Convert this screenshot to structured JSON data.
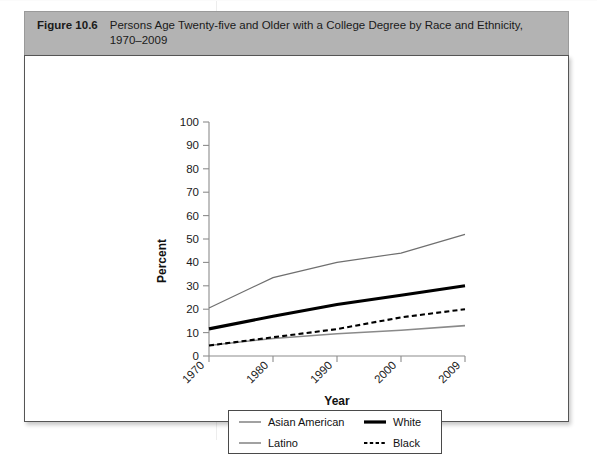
{
  "figure": {
    "number": "Figure 10.6",
    "title": "Persons Age Twenty-five and Older with a College Degree by Race and Ethnicity, 1970–2009"
  },
  "chart_data": {
    "type": "line",
    "title": "",
    "xlabel": "Year",
    "ylabel": "Percent",
    "x": [
      "1970",
      "1980",
      "1990",
      "2000",
      "2009"
    ],
    "xlim": [
      1970,
      2009
    ],
    "ylim": [
      0,
      100
    ],
    "yticks": [
      "0",
      "10",
      "20",
      "30",
      "40",
      "50",
      "60",
      "70",
      "80",
      "90",
      "100"
    ],
    "grid": false,
    "legend_position": "below-plot",
    "series": [
      {
        "name": "Asian American",
        "style": "thin-gray-solid",
        "color": "#6f6f6f",
        "values": [
          20.5,
          33.5,
          40.0,
          44.0,
          52.0
        ]
      },
      {
        "name": "White",
        "style": "thick-black-solid",
        "color": "#000000",
        "values": [
          11.6,
          17.0,
          22.0,
          26.0,
          30.0
        ]
      },
      {
        "name": "Black",
        "style": "black-dashed",
        "color": "#000000",
        "values": [
          4.5,
          8.0,
          11.5,
          16.5,
          20.0
        ]
      },
      {
        "name": "Latino",
        "style": "thin-gray-solid",
        "color": "#8a8a8a",
        "values": [
          4.5,
          7.5,
          9.5,
          11.0,
          13.0
        ]
      }
    ]
  },
  "legend": {
    "entries": [
      {
        "label": "Asian American",
        "icon": "thin-line-swatch"
      },
      {
        "label": "White",
        "icon": "thick-line-swatch"
      },
      {
        "label": "Latino",
        "icon": "thin-line-swatch"
      },
      {
        "label": "Black",
        "icon": "dashed-line-swatch"
      }
    ]
  },
  "axes": {
    "y_label": "Percent",
    "x_label": "Year",
    "y_ticks": [
      "100",
      "90",
      "80",
      "70",
      "60",
      "50",
      "40",
      "30",
      "20",
      "10",
      "0"
    ],
    "x_ticks": [
      "1970",
      "1980",
      "1990",
      "2000",
      "2009"
    ]
  },
  "colors": {
    "caption_bar": "#b3b3b3",
    "panel_border": "#555555",
    "axis": "#8c8c8c",
    "white_series": "#000000",
    "gray_series": "#7a7a7a"
  }
}
